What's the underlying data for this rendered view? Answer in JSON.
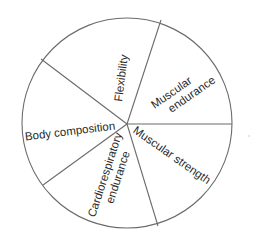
{
  "diagram": {
    "type": "pie-segments",
    "center": [
      127,
      123
    ],
    "radius": 105,
    "stroke_color": "#6b6b6b",
    "text_color": "#2a2a2a",
    "divider_endpoints": [
      [
        161,
        20
      ],
      [
        232,
        124
      ],
      [
        158,
        226
      ],
      [
        43,
        185
      ],
      [
        41,
        59
      ]
    ],
    "segments": [
      {
        "name": "flexibility",
        "lines": [
          "Flexibility"
        ],
        "x": 121,
        "y": 78,
        "rotate": -83
      },
      {
        "name": "muscular-endurance",
        "lines": [
          "Muscular",
          "endurance"
        ],
        "x": 181,
        "y": 93,
        "rotate": -35
      },
      {
        "name": "muscular-strength",
        "lines": [
          "Muscular strength"
        ],
        "x": 172,
        "y": 155,
        "rotate": 35
      },
      {
        "name": "cardiorespiratory-endurance",
        "lines": [
          "Cardiorespiratory",
          "endurance"
        ],
        "x": 111,
        "y": 175,
        "rotate": -72
      },
      {
        "name": "body-composition",
        "lines": [
          "Body composition"
        ],
        "x": 70,
        "y": 131,
        "rotate": -7
      }
    ]
  },
  "labels": {
    "flexibility": "Flexibility",
    "muscular_endurance_1": "Muscular",
    "muscular_endurance_2": "endurance",
    "muscular_strength": "Muscular strength",
    "cardio_1": "Cardiorespiratory",
    "cardio_2": "endurance",
    "body_composition": "Body composition"
  }
}
